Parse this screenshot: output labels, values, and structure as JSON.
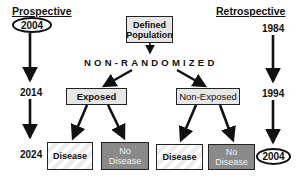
{
  "prospective": {
    "title": "Prospective",
    "years": [
      "2004",
      "2014",
      "2024"
    ],
    "start_year_circled": "2004"
  },
  "retrospective": {
    "title": "Retrospective",
    "years": [
      "1984",
      "1994",
      "2004"
    ],
    "end_year_circled": "2004"
  },
  "population": {
    "line1": "Defined",
    "line2": "Population"
  },
  "banner": "NON-RANDOMIZED",
  "groups": [
    {
      "label": "Exposed",
      "outcomes": [
        {
          "label_line1": "Disease",
          "label_line2": "",
          "style": "light"
        },
        {
          "label_line1": "No",
          "label_line2": "Disease",
          "style": "dark"
        }
      ]
    },
    {
      "label": "Non-Exposed",
      "outcomes": [
        {
          "label_line1": "Disease",
          "label_line2": "",
          "style": "light"
        },
        {
          "label_line1": "No",
          "label_line2": "Disease",
          "style": "dark"
        }
      ]
    }
  ],
  "colors": {
    "line": "#111111",
    "box_light": "#e6e6e6",
    "box_dark": "#8a8a8a",
    "background": "#ffffff"
  }
}
